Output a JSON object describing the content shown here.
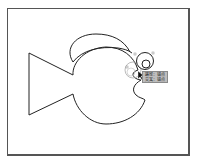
{
  "canvas": {
    "artboard": {
      "stroke": "#555555",
      "fill": "#ffffff"
    },
    "drawing": {
      "subject": "fish outline",
      "stroke": "#222222",
      "shapes": [
        "tail",
        "dorsal-fin",
        "body",
        "mouth",
        "eye-outer",
        "eye-inner"
      ]
    },
    "ghost_preview": {
      "stroke": "#aaaaaa"
    }
  },
  "smart_guide": {
    "cursor": "arrow-pointer",
    "line1": "路径：锚点",
    "line2": "交叉：锚点"
  }
}
